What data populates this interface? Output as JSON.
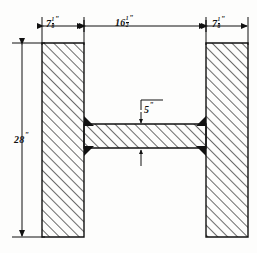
{
  "drawing": {
    "type": "engineering-cross-section",
    "subject": "H-beam cross section",
    "ink_color": "#111111",
    "paper_color": "#fdfdfc",
    "hatch_color": "#333333",
    "dimensions": [
      {
        "id": "left-flange-width",
        "value": "7",
        "fraction_num": "1",
        "fraction_den": "8",
        "unit": "\"",
        "orientation": "horizontal"
      },
      {
        "id": "clear-span",
        "value": "16",
        "fraction_num": "1",
        "fraction_den": "2",
        "unit": "\"",
        "orientation": "horizontal"
      },
      {
        "id": "right-flange-width",
        "value": "7",
        "fraction_num": "1",
        "fraction_den": "8",
        "unit": "\"",
        "orientation": "horizontal"
      },
      {
        "id": "overall-height",
        "value": "28",
        "fraction_num": "",
        "fraction_den": "",
        "unit": "\"",
        "orientation": "vertical"
      },
      {
        "id": "web-thickness",
        "value": "5",
        "fraction_num": "",
        "fraction_den": "",
        "unit": "\"",
        "orientation": "leader"
      }
    ]
  }
}
